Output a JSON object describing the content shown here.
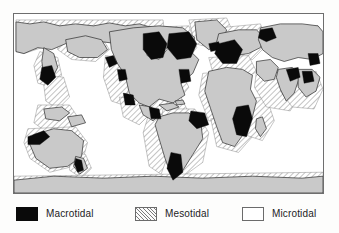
{
  "figure": {
    "type": "thematic-world-map",
    "projection_note": "world map, land shaded grey, oceans white"
  },
  "map": {
    "land_color": "#c9c9c9",
    "ocean_color": "#ffffff",
    "coastline_color": "#2a2a2a",
    "frame_color": "#6e6e6e",
    "macrotidal_color": "#0a0a0a",
    "mesotidal_color": "#7a7a7a",
    "microtidal_color": "#ffffff"
  },
  "legend": {
    "items": [
      {
        "key": "macrotidal",
        "label": "Macrotidal",
        "swatch": "solid-black-swatch"
      },
      {
        "key": "mesotidal",
        "label": "Mesotidal",
        "swatch": "diagonal-hatch-swatch"
      },
      {
        "key": "microtidal",
        "label": "Microtidal",
        "swatch": "white-outline-swatch"
      }
    ]
  }
}
